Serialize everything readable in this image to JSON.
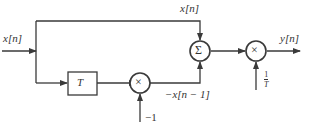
{
  "diagram": {
    "type": "block-diagram",
    "labels": {
      "input": "x[n]",
      "top_branch": "x[n]",
      "delayed": "−x[n − 1]",
      "gain_neg": "−1",
      "output": "y[n]",
      "scale_num": "1",
      "scale_den": "T"
    },
    "blocks": {
      "delay": "T",
      "summer": "Σ",
      "mult1": "×",
      "mult2": "×"
    },
    "colors": {
      "line": "#3a3a3a",
      "background": "#ffffff"
    }
  }
}
